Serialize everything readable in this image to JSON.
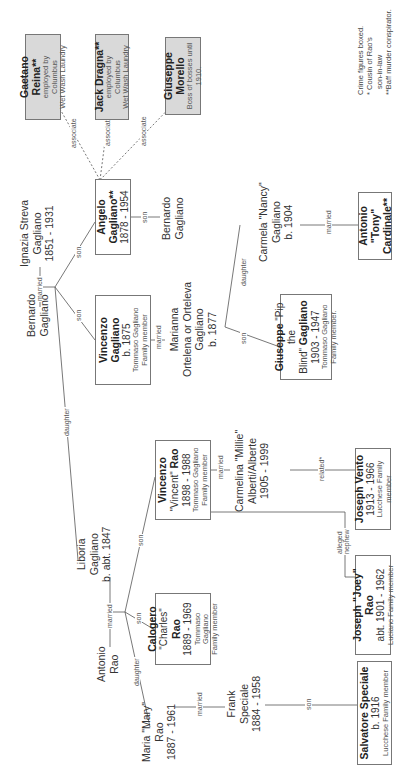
{
  "legend": {
    "line1": "Crime figures boxed.",
    "line2": "* Cousin of Rao's",
    "line3": "son-in-law",
    "line4": "**Baff murder conspirator."
  },
  "crime_boxes": [
    {
      "name": "Gaetano Reina**",
      "note1": "employed by Columbus",
      "note2": "Wet Wash Laundry"
    },
    {
      "name": "Jack Dragna**",
      "note1": "employed by Columbus",
      "note2": "Wet Wash Laundry"
    },
    {
      "name": "Giuseppe Morello",
      "name_line1": "Giuseppe",
      "name_line2": "Morello",
      "note1": "Boss of bosses until",
      "note2": "1910."
    }
  ],
  "people": {
    "antonio_rao": {
      "line1": "Antonio",
      "line2": "Rao"
    },
    "maria_rao": {
      "line1": "Maria \"Mary\"",
      "line2": "Rao",
      "line3": "1887 - 1961"
    },
    "frank_speciale": {
      "line1": "Frank",
      "line2": "Speciale",
      "line3": "1884 - 1958"
    },
    "salvatore_speciale": {
      "name": "Salvatore Speciale",
      "dates": "b. 1916",
      "sub": "Lucchese Family member"
    },
    "liboria_gagliano": {
      "line1": "Liboria",
      "line2": "Gagliano",
      "line3": "b. abt. 1847"
    },
    "calogero_rao": {
      "name1": "Calogero",
      "name2a": "\"Charles\" ",
      "name2b": "Rao",
      "dates": "1889 - 1969",
      "sub1": "Tommaso Gagliano",
      "sub2": "Family member"
    },
    "vincenzo_rao": {
      "name1": "Vincenzo",
      "name2a": "\"Vincent\" ",
      "name2b": "Rao",
      "dates": "1898 - 1988",
      "sub1": "Tommaso Gagliano",
      "sub2": "Family member"
    },
    "carmelina": {
      "line1": "Carmelina \"Millie\"",
      "line2": "Alberti/Alberte",
      "line3": "1905 - 1999"
    },
    "joey_rao": {
      "name": "Joseph \"Joey\" Rao",
      "dates": "abt. 1901 - 1962",
      "sub": "Luciano Family member"
    },
    "joseph_vento": {
      "name": "Joseph Vento",
      "dates": "1913 - 1966",
      "sub": "Lucchese Family member"
    },
    "bernardo_sr": {
      "line1": "Bernardo",
      "line2": "Gagliano"
    },
    "ignazia": {
      "line1": "Ignazia Streva",
      "line2": "Gagliano",
      "line3": "1851 - 1931"
    },
    "vincenzo_gagliano": {
      "name1": "Vincenzo",
      "name2": "Gagliano",
      "dates": "b. 1875",
      "sub1": "Tommaso Gagliano",
      "sub2": "Family member"
    },
    "marianna": {
      "line1": "Marianna",
      "line2": "Ortelena or Orteleva",
      "line3": "Gagliano",
      "line4": "b. 1877"
    },
    "giuseppe_pip": {
      "name1a": "Giuseppe",
      "name1b": " \"Pip the",
      "name2a": "Blind\" ",
      "name2b": "Gagliano",
      "dates": "1903 - 1947",
      "sub1": "Tommaso Gagliano",
      "sub2": "Family member."
    },
    "carmela_nancy": {
      "line1": "Carmela \"Nancy\"",
      "line2": "Gagliano",
      "line3": "b. 1904"
    },
    "tony_cardinale": {
      "name1": "Antonio \"Tony\"",
      "name2": "Cardinale**"
    },
    "angelo": {
      "name1": "Angelo",
      "name2": "Gagliano**",
      "dates": "1878 - 1954"
    },
    "bernardo_jr": {
      "line1": "Bernardo",
      "line2": "Gagliano"
    }
  },
  "relations": {
    "married": "married",
    "son": "son",
    "daughter": "daughter",
    "associate": "associate",
    "related": "related*",
    "alleged1": "alleged",
    "alleged2": "nephew"
  }
}
